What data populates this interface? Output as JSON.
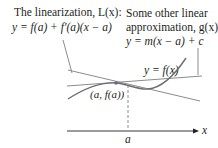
{
  "figure": {
    "linearization_label": {
      "line1": "The linearization, L(x):",
      "line2": "y = f(a) + f′(a)(x − a)"
    },
    "other_approx_label": {
      "line1": "Some other linear",
      "line2": "approximation, g(x):",
      "line3": "y = m(x − a) + c"
    },
    "curve_label": "y = f(x)",
    "point_label": "(a, f(a))",
    "axis_label": "x",
    "tick_label": "a",
    "colors": {
      "curve": "#6d6e71",
      "lines": "#8a8c8e",
      "axis": "#231f20",
      "text": "#231f20"
    }
  }
}
